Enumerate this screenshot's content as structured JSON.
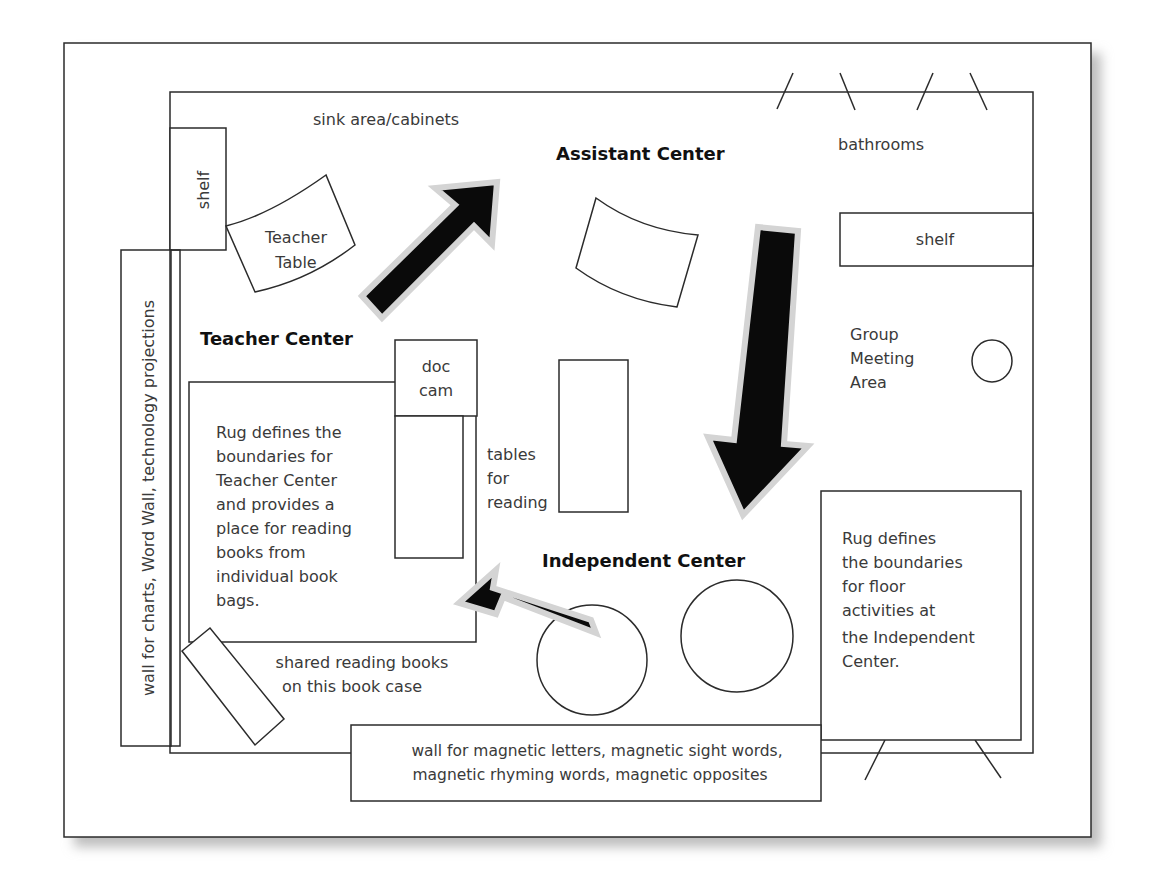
{
  "diagram": {
    "type": "classroom floor plan",
    "colors": {
      "line": "#2b2b2b",
      "text": "#3a3a3a",
      "heading": "#111111",
      "arrow_fill": "#0a0a0a",
      "arrow_outline": "#d4d4d4",
      "shadow": "#bdbdbd"
    },
    "labels": {
      "sink_area": "sink area/cabinets",
      "bathrooms": "bathrooms",
      "shelf_left": "shelf",
      "shelf_right": "shelf",
      "teacher_table_line1": "Teacher",
      "teacher_table_line2": "Table",
      "assistant_center": "Assistant Center",
      "teacher_center": "Teacher Center",
      "independent_center": "Independent Center",
      "doc_cam_line1": "doc",
      "doc_cam_line2": "cam",
      "tables_line1": "tables",
      "tables_line2": "for",
      "tables_line3": "reading",
      "group_line1": "Group",
      "group_line2": "Meeting",
      "group_line3": "Area",
      "left_wall": "wall for charts, Word Wall, technology projections",
      "rug_teacher": [
        "Rug defines the",
        "boundaries for",
        "Teacher Center",
        "and provides a",
        "place for reading",
        "books from",
        "individual book",
        "bags."
      ],
      "rug_independent": [
        "Rug defines",
        "the boundaries",
        "for floor",
        "activities at",
        "the Independent",
        "Center."
      ],
      "bookcase_line1": "shared reading books",
      "bookcase_line2": "on this book case",
      "magnetic_wall_line1": "wall for magnetic letters, magnetic sight words,",
      "magnetic_wall_line2": "magnetic rhyming words, magnetic opposites"
    },
    "arrows": [
      {
        "name": "teacher-to-assistant",
        "direction": "up-right"
      },
      {
        "name": "assistant-to-independent",
        "direction": "down"
      },
      {
        "name": "independent-to-teacher",
        "direction": "left"
      }
    ]
  }
}
